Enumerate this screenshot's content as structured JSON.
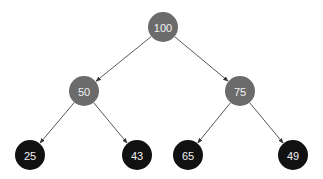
{
  "diagram": {
    "type": "binary-tree",
    "colors": {
      "background": "#ffffff",
      "inner_node": "#6b6b6b",
      "leaf_node": "#111111",
      "edge": "#444444",
      "label": "#f2f2f2"
    },
    "nodes": [
      {
        "id": "n100",
        "label": "100",
        "level": 0,
        "kind": "inner",
        "cx": 163,
        "cy": 27,
        "r": 15
      },
      {
        "id": "n50",
        "label": "50",
        "level": 1,
        "kind": "inner",
        "cx": 84,
        "cy": 91,
        "r": 15
      },
      {
        "id": "n75",
        "label": "75",
        "level": 1,
        "kind": "inner",
        "cx": 240,
        "cy": 91,
        "r": 15
      },
      {
        "id": "n25",
        "label": "25",
        "level": 2,
        "kind": "leaf",
        "cx": 30,
        "cy": 155,
        "r": 15
      },
      {
        "id": "n43",
        "label": "43",
        "level": 2,
        "kind": "leaf",
        "cx": 137,
        "cy": 155,
        "r": 15
      },
      {
        "id": "n65",
        "label": "65",
        "level": 2,
        "kind": "leaf",
        "cx": 188,
        "cy": 155,
        "r": 15
      },
      {
        "id": "n49",
        "label": "49",
        "level": 2,
        "kind": "leaf",
        "cx": 293,
        "cy": 155,
        "r": 15
      }
    ],
    "edges": [
      {
        "from": "n100",
        "to": "n50"
      },
      {
        "from": "n100",
        "to": "n75"
      },
      {
        "from": "n50",
        "to": "n25"
      },
      {
        "from": "n50",
        "to": "n43"
      },
      {
        "from": "n75",
        "to": "n65"
      },
      {
        "from": "n75",
        "to": "n49"
      }
    ]
  }
}
